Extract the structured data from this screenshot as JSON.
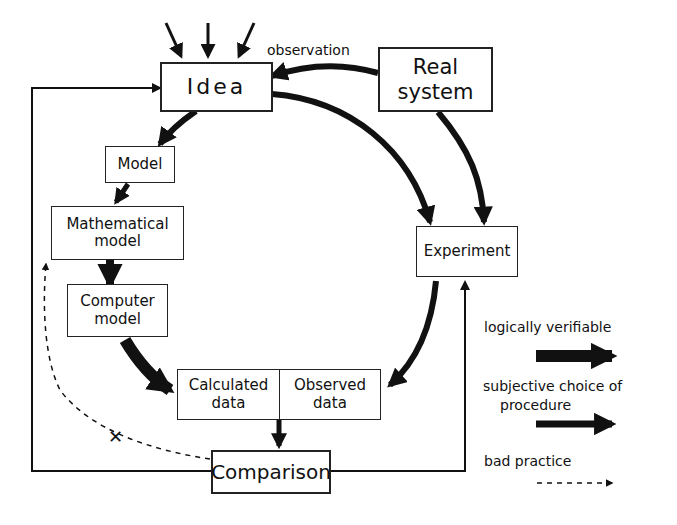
{
  "nodes": {
    "idea": "Idea",
    "real_system": [
      "Real",
      "system"
    ],
    "model": "Model",
    "mathematical_model": [
      "Mathematical",
      "model"
    ],
    "computer_model": [
      "Computer",
      "model"
    ],
    "experiment": "Experiment",
    "calculated_data": [
      "Calculated",
      "data"
    ],
    "observed_data": [
      "Observed",
      "data"
    ],
    "comparison": "Comparison"
  },
  "edge_labels": {
    "observation": "observation",
    "bad_practice_mark": "✕"
  },
  "legend": {
    "logically_verifiable": "logically  verifiable",
    "subjective_choice": [
      "subjective  choice  of",
      "procedure"
    ],
    "bad_practice": "bad  practice"
  }
}
